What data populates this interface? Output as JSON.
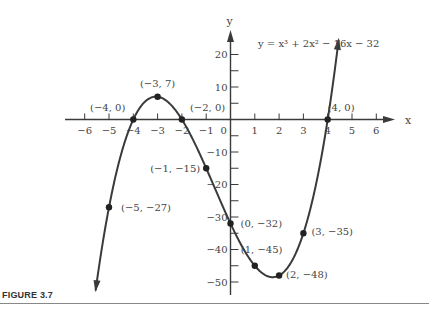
{
  "figure": {
    "caption": "FIGURE 3.7"
  },
  "chart_data": {
    "type": "line",
    "title": "y = x³ + 2x² − 16x − 32",
    "equation": "y = x³ + 2x² − 16x − 32",
    "xlabel": "x",
    "ylabel": "y",
    "xlim": [
      -6,
      6
    ],
    "ylim": [
      -50,
      20
    ],
    "grid": false,
    "x_ticks": [
      -6,
      -5,
      -4,
      -3,
      -2,
      -1,
      0,
      1,
      2,
      3,
      4,
      5,
      6
    ],
    "x_tick_labels": [
      "−6",
      "−5",
      "−4",
      "−3",
      "−2",
      "−1",
      "0",
      "1",
      "2",
      "3",
      "4",
      "5",
      "6"
    ],
    "y_ticks": [
      20,
      15,
      10,
      5,
      -5,
      -10,
      -15,
      -20,
      -25,
      -30,
      -35,
      -40,
      -45,
      -50
    ],
    "y_tick_labels": [
      "20",
      "10",
      "−10",
      "−20",
      "−30",
      "−40",
      "−50"
    ],
    "y_labeled_ticks": [
      20,
      10,
      -10,
      -20,
      -30,
      -40,
      -50
    ],
    "points": [
      {
        "x": -5,
        "y": -27,
        "label": "(−5, −27)"
      },
      {
        "x": -4,
        "y": 0,
        "label": "(−4, 0)"
      },
      {
        "x": -3,
        "y": 7,
        "label": "(−3, 7)"
      },
      {
        "x": -2,
        "y": 0,
        "label": "(−2, 0)"
      },
      {
        "x": -1,
        "y": -15,
        "label": "(−1, −15)"
      },
      {
        "x": 0,
        "y": -32,
        "label": "(0, −32)"
      },
      {
        "x": 1,
        "y": -45,
        "label": "(1, −45)"
      },
      {
        "x": 2,
        "y": -48,
        "label": "(2, −48)"
      },
      {
        "x": 3,
        "y": -35,
        "label": "(3, −35)"
      },
      {
        "x": 4,
        "y": 0,
        "label": "(4, 0)"
      }
    ],
    "series": [
      {
        "name": "y = x³ + 2x² − 16x − 32",
        "x": [
          -5,
          -4,
          -3,
          -2,
          -1,
          0,
          1,
          2,
          3,
          4
        ],
        "values": [
          -27,
          0,
          7,
          0,
          -15,
          -32,
          -45,
          -48,
          -35,
          0
        ]
      }
    ]
  }
}
